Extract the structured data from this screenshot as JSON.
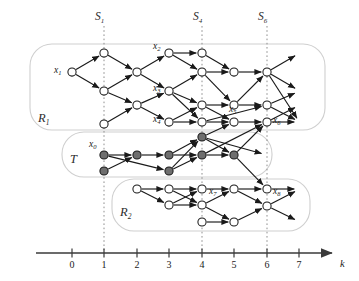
{
  "figure": {
    "type": "time-expanded-network-diagram",
    "axis": {
      "variable_label": "k",
      "ticks": [
        {
          "value": "0",
          "x": 72
        },
        {
          "value": "1",
          "x": 104
        },
        {
          "value": "2",
          "x": 137
        },
        {
          "value": "3",
          "x": 169
        },
        {
          "value": "4",
          "x": 202
        },
        {
          "value": "5",
          "x": 234
        },
        {
          "value": "6",
          "x": 267
        },
        {
          "value": "7",
          "x": 299
        }
      ],
      "y": 253,
      "start_x": 36,
      "end_x": 332
    },
    "section_markers": [
      {
        "label": "S",
        "sub": "1",
        "x": 104
      },
      {
        "label": "S",
        "sub": "4",
        "x": 202
      },
      {
        "label": "S",
        "sub": "6",
        "x": 267
      }
    ],
    "regions": [
      {
        "name": "region-r1",
        "label": "R",
        "sub": "1",
        "label_x": 38,
        "label_y": 122,
        "x": 30,
        "y": 44,
        "w": 295,
        "h": 86
      },
      {
        "name": "region-t",
        "label": "T",
        "sub": "",
        "label_x": 70,
        "label_y": 163,
        "x": 62,
        "y": 132,
        "w": 210,
        "h": 45
      },
      {
        "name": "region-r2",
        "label": "R",
        "sub": "2",
        "label_x": 120,
        "label_y": 216,
        "x": 112,
        "y": 179,
        "w": 198,
        "h": 52
      }
    ],
    "node_labels": [
      {
        "id": "x0",
        "var": "x",
        "sub": "0",
        "x": 89,
        "y": 147
      },
      {
        "id": "x1",
        "var": "x",
        "sub": "1",
        "x": 54,
        "y": 73
      },
      {
        "id": "x2",
        "var": "x",
        "sub": "2",
        "x": 153,
        "y": 49
      },
      {
        "id": "x3",
        "var": "x",
        "sub": "3",
        "x": 153,
        "y": 91
      },
      {
        "id": "x4",
        "var": "x",
        "sub": "4",
        "x": 153,
        "y": 122
      },
      {
        "id": "x5",
        "var": "x",
        "sub": "5",
        "x": 229,
        "y": 112
      },
      {
        "id": "x6",
        "var": "x",
        "sub": "6",
        "x": 273,
        "y": 123
      },
      {
        "id": "x7",
        "var": "x",
        "sub": "7",
        "x": 209,
        "y": 194
      },
      {
        "id": "x8",
        "var": "x",
        "sub": "8",
        "x": 273,
        "y": 194
      }
    ],
    "nodes": [
      {
        "k": 0,
        "x": 72,
        "y": 72,
        "fill": "open"
      },
      {
        "k": 1,
        "x": 104,
        "y": 53,
        "fill": "open"
      },
      {
        "k": 1,
        "x": 104,
        "y": 91,
        "fill": "open"
      },
      {
        "k": 1,
        "x": 104,
        "y": 124,
        "fill": "open"
      },
      {
        "k": 2,
        "x": 137,
        "y": 72,
        "fill": "open"
      },
      {
        "k": 2,
        "x": 137,
        "y": 105,
        "fill": "open"
      },
      {
        "k": 3,
        "x": 169,
        "y": 53,
        "fill": "open"
      },
      {
        "k": 3,
        "x": 169,
        "y": 91,
        "fill": "open"
      },
      {
        "k": 3,
        "x": 169,
        "y": 122,
        "fill": "open"
      },
      {
        "k": 4,
        "x": 202,
        "y": 53,
        "fill": "open"
      },
      {
        "k": 4,
        "x": 202,
        "y": 72,
        "fill": "open"
      },
      {
        "k": 4,
        "x": 202,
        "y": 105,
        "fill": "open"
      },
      {
        "k": 4,
        "x": 202,
        "y": 122,
        "fill": "open"
      },
      {
        "k": 5,
        "x": 234,
        "y": 72,
        "fill": "open"
      },
      {
        "k": 5,
        "x": 234,
        "y": 105,
        "fill": "open"
      },
      {
        "k": 5,
        "x": 234,
        "y": 122,
        "fill": "open"
      },
      {
        "k": 6,
        "x": 267,
        "y": 72,
        "fill": "open"
      },
      {
        "k": 6,
        "x": 267,
        "y": 105,
        "fill": "open"
      },
      {
        "k": 6,
        "x": 267,
        "y": 122,
        "fill": "open"
      },
      {
        "k": 1,
        "x": 104,
        "y": 155,
        "fill": "solid"
      },
      {
        "k": 1,
        "x": 104,
        "y": 171,
        "fill": "solid"
      },
      {
        "k": 2,
        "x": 137,
        "y": 155,
        "fill": "solid"
      },
      {
        "k": 3,
        "x": 169,
        "y": 155,
        "fill": "solid"
      },
      {
        "k": 3,
        "x": 169,
        "y": 171,
        "fill": "solid"
      },
      {
        "k": 4,
        "x": 202,
        "y": 137,
        "fill": "solid"
      },
      {
        "k": 4,
        "x": 202,
        "y": 155,
        "fill": "solid"
      },
      {
        "k": 5,
        "x": 234,
        "y": 155,
        "fill": "solid"
      },
      {
        "k": 2,
        "x": 137,
        "y": 189,
        "fill": "open"
      },
      {
        "k": 3,
        "x": 169,
        "y": 189,
        "fill": "open"
      },
      {
        "k": 3,
        "x": 169,
        "y": 205,
        "fill": "open"
      },
      {
        "k": 4,
        "x": 202,
        "y": 189,
        "fill": "open"
      },
      {
        "k": 4,
        "x": 202,
        "y": 205,
        "fill": "open"
      },
      {
        "k": 4,
        "x": 202,
        "y": 222,
        "fill": "open"
      },
      {
        "k": 5,
        "x": 234,
        "y": 189,
        "fill": "open"
      },
      {
        "k": 5,
        "x": 234,
        "y": 222,
        "fill": "open"
      },
      {
        "k": 6,
        "x": 267,
        "y": 189,
        "fill": "open"
      },
      {
        "k": 6,
        "x": 267,
        "y": 206,
        "fill": "open"
      }
    ],
    "edges": [
      [
        72,
        72,
        104,
        53
      ],
      [
        72,
        72,
        104,
        91
      ],
      [
        104,
        53,
        137,
        72
      ],
      [
        104,
        91,
        137,
        72
      ],
      [
        104,
        91,
        137,
        105
      ],
      [
        104,
        124,
        137,
        105
      ],
      [
        137,
        72,
        169,
        53
      ],
      [
        137,
        72,
        169,
        91
      ],
      [
        137,
        105,
        169,
        91
      ],
      [
        137,
        105,
        169,
        122
      ],
      [
        169,
        53,
        202,
        53
      ],
      [
        169,
        53,
        202,
        72
      ],
      [
        169,
        91,
        202,
        72
      ],
      [
        169,
        91,
        202,
        105
      ],
      [
        169,
        91,
        202,
        122
      ],
      [
        169,
        122,
        202,
        122
      ],
      [
        169,
        122,
        202,
        105
      ],
      [
        202,
        53,
        234,
        72
      ],
      [
        202,
        72,
        234,
        72
      ],
      [
        202,
        72,
        234,
        105
      ],
      [
        202,
        105,
        234,
        105
      ],
      [
        202,
        105,
        234,
        122
      ],
      [
        202,
        122,
        234,
        122
      ],
      [
        202,
        122,
        267,
        105
      ],
      [
        234,
        72,
        267,
        72
      ],
      [
        234,
        105,
        267,
        105
      ],
      [
        234,
        105,
        267,
        72
      ],
      [
        234,
        122,
        267,
        122
      ],
      [
        267,
        72,
        300,
        53
      ],
      [
        267,
        72,
        300,
        91
      ],
      [
        267,
        105,
        300,
        91
      ],
      [
        267,
        105,
        300,
        122
      ],
      [
        267,
        122,
        300,
        122
      ],
      [
        267,
        122,
        300,
        105
      ],
      [
        267,
        72,
        300,
        123
      ],
      [
        104,
        155,
        137,
        155
      ],
      [
        104,
        171,
        137,
        155
      ],
      [
        137,
        155,
        169,
        155
      ],
      [
        169,
        155,
        202,
        155
      ],
      [
        169,
        155,
        202,
        137
      ],
      [
        104,
        155,
        169,
        171
      ],
      [
        169,
        171,
        202,
        155
      ],
      [
        202,
        137,
        234,
        155
      ],
      [
        202,
        155,
        234,
        155
      ],
      [
        169,
        171,
        202,
        137
      ],
      [
        202,
        137,
        267,
        155
      ],
      [
        234,
        155,
        267,
        122
      ],
      [
        234,
        155,
        267,
        189
      ],
      [
        137,
        189,
        169,
        189
      ],
      [
        137,
        189,
        169,
        205
      ],
      [
        169,
        189,
        202,
        189
      ],
      [
        169,
        205,
        202,
        205
      ],
      [
        169,
        189,
        202,
        205
      ],
      [
        169,
        205,
        202,
        189
      ],
      [
        202,
        189,
        234,
        189
      ],
      [
        202,
        205,
        234,
        189
      ],
      [
        202,
        205,
        234,
        222
      ],
      [
        202,
        222,
        234,
        222
      ],
      [
        234,
        189,
        267,
        189
      ],
      [
        234,
        189,
        267,
        206
      ],
      [
        234,
        222,
        267,
        206
      ],
      [
        267,
        189,
        300,
        189
      ],
      [
        267,
        206,
        300,
        189
      ],
      [
        267,
        206,
        300,
        222
      ],
      [
        202,
        137,
        234,
        122
      ],
      [
        202,
        155,
        267,
        122
      ]
    ],
    "colors": {
      "node_stroke": "#1a1a1a",
      "node_open_fill": "#ffffff",
      "node_solid_fill": "#6e6e6e",
      "edge": "#1a1a1a",
      "region_border": "#cfcfcf",
      "dotted_marker": "#8f8f8f",
      "axis": "#3a3a3a"
    }
  }
}
